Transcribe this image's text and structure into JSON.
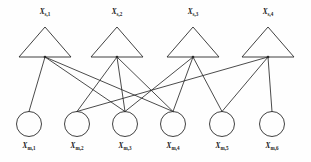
{
  "figure": {
    "type": "factor-graph",
    "background_color": "#fefefe",
    "stroke_color": "#2b2b2b"
  },
  "factor_nodes": [
    {
      "id": "s1",
      "label_base": "X",
      "label_sub": "s,1",
      "cx": 45,
      "cy": 57,
      "apex_y": 27,
      "half_width": 26
    },
    {
      "id": "s2",
      "label_base": "X",
      "label_sub": "s,2",
      "cx": 117,
      "cy": 57,
      "apex_y": 27,
      "half_width": 26
    },
    {
      "id": "s3",
      "label_base": "X",
      "label_sub": "s,3",
      "cx": 193,
      "cy": 57,
      "apex_y": 27,
      "half_width": 26
    },
    {
      "id": "s4",
      "label_base": "X",
      "label_sub": "s,4",
      "cx": 268,
      "cy": 57,
      "apex_y": 27,
      "half_width": 26
    }
  ],
  "variable_nodes": [
    {
      "id": "m1",
      "label_base": "X",
      "label_sub": "m,1",
      "cx": 29,
      "cy": 124,
      "r": 12.5
    },
    {
      "id": "m2",
      "label_base": "X",
      "label_sub": "m,2",
      "cx": 77,
      "cy": 124,
      "r": 12.5
    },
    {
      "id": "m3",
      "label_base": "X",
      "label_sub": "m,3",
      "cx": 125,
      "cy": 124,
      "r": 12.5
    },
    {
      "id": "m4",
      "label_base": "X",
      "label_sub": "m,4",
      "cx": 173,
      "cy": 124,
      "r": 12.5
    },
    {
      "id": "m5",
      "label_base": "X",
      "label_sub": "m,5",
      "cx": 222,
      "cy": 124,
      "r": 12.5
    },
    {
      "id": "m6",
      "label_base": "X",
      "label_sub": "m,6",
      "cx": 272,
      "cy": 124,
      "r": 12.5
    }
  ],
  "edges": [
    {
      "from": "s1",
      "to": "m1"
    },
    {
      "from": "s1",
      "to": "m3"
    },
    {
      "from": "s1",
      "to": "m4"
    },
    {
      "from": "s2",
      "to": "m2"
    },
    {
      "from": "s2",
      "to": "m3"
    },
    {
      "from": "s2",
      "to": "m4"
    },
    {
      "from": "s3",
      "to": "m3"
    },
    {
      "from": "s3",
      "to": "m4"
    },
    {
      "from": "s3",
      "to": "m5"
    },
    {
      "from": "s4",
      "to": "m2"
    },
    {
      "from": "s4",
      "to": "m5"
    },
    {
      "from": "s4",
      "to": "m6"
    }
  ],
  "degrees": {
    "variable_node_degrees": [
      1,
      2,
      3,
      3,
      2,
      1
    ],
    "factor_node_degrees": [
      3,
      3,
      3,
      3
    ]
  }
}
